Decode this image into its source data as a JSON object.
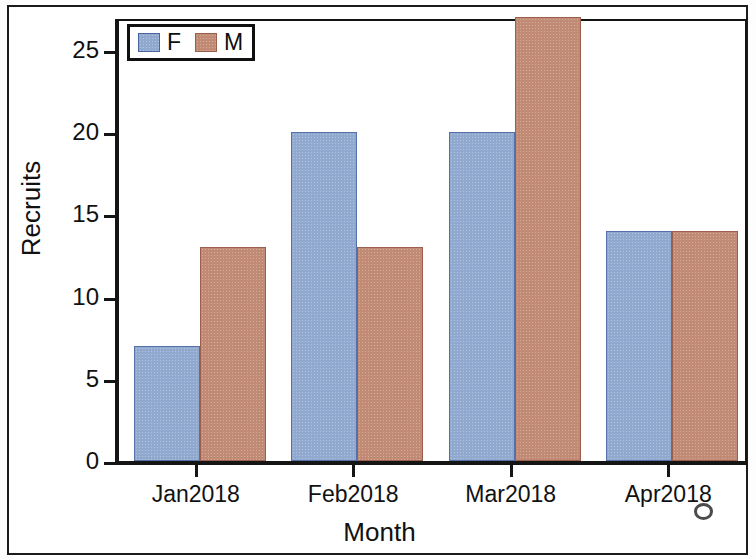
{
  "chart_data": {
    "type": "bar",
    "title": "",
    "xlabel": "Month",
    "ylabel": "Recruits",
    "categories": [
      "Jan2018",
      "Feb2018",
      "Mar2018",
      "Apr2018"
    ],
    "series": [
      {
        "name": "F",
        "color": "#91a9cf",
        "values": [
          7,
          20,
          20,
          14
        ]
      },
      {
        "name": "M",
        "color": "#c08a74",
        "values": [
          13,
          13,
          27,
          14
        ]
      }
    ],
    "ylim": [
      0,
      27
    ],
    "yticks": [
      0,
      5,
      10,
      15,
      20,
      25
    ],
    "ytick_labels": [
      "0",
      "5",
      "10",
      "15",
      "20",
      "25"
    ],
    "grid": false,
    "legend_position": "top-left",
    "bar_style": "grouped-adjacent"
  },
  "legend": {
    "items": [
      {
        "label": "F",
        "color": "#91a9cf"
      },
      {
        "label": "M",
        "color": "#c08a74"
      }
    ]
  },
  "axes": {
    "y_title": "Recruits",
    "x_title": "Month"
  }
}
